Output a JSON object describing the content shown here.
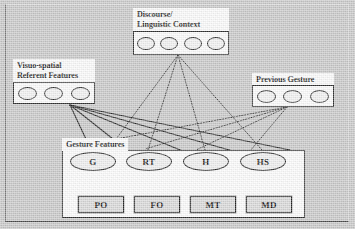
{
  "figure": {
    "kind": "neural-network-architecture-diagram",
    "background_color": "#c9c9c9",
    "frame_color": "#4a4a4a"
  },
  "groups": {
    "discourse": {
      "label_line1": "Discourse/",
      "label_line2": "Linguistic Context",
      "unit_count": 4,
      "units": [
        "unit-1",
        "unit-2",
        "unit-3",
        "unit-4"
      ]
    },
    "visuo_spatial": {
      "label_line1": "Visuo-spatial",
      "label_line2": "Referent Features",
      "unit_count": 3,
      "units": [
        "unit-1",
        "unit-2",
        "unit-3"
      ]
    },
    "previous_gesture": {
      "label_line1": "Previous Gesture",
      "unit_count": 3,
      "units": [
        "unit-1",
        "unit-2",
        "unit-3"
      ]
    },
    "gesture_features": {
      "label_line1": "Gesture Features",
      "hidden_nodes": [
        "G",
        "RT",
        "H",
        "HS"
      ],
      "output_nodes": [
        "PO",
        "FO",
        "MT",
        "MD"
      ]
    }
  },
  "edges": {
    "discourse_style": "dotted",
    "previous_gesture_style": "dotted",
    "visuo_spatial_style": "solid",
    "internal_style": "solid"
  }
}
